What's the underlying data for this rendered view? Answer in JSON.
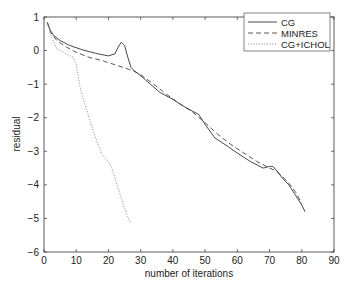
{
  "chart_data": {
    "type": "line",
    "title": "",
    "xlabel": "number of iterations",
    "ylabel": "residual",
    "xlim": [
      0,
      90
    ],
    "ylim": [
      -6,
      1
    ],
    "xticks": [
      "0",
      "10",
      "20",
      "30",
      "40",
      "50",
      "60",
      "70",
      "80",
      "90"
    ],
    "yticks": [
      "1",
      "0",
      "-1",
      "-2",
      "-3",
      "-4",
      "-5",
      "-6"
    ],
    "grid": false,
    "legend_position": "top-right",
    "series": [
      {
        "name": "CG",
        "style": "solid",
        "x": [
          1,
          2,
          3,
          5,
          8,
          12,
          16,
          20,
          22,
          23,
          24,
          25,
          26,
          27,
          28,
          30,
          33,
          36,
          40,
          44,
          46,
          48,
          50,
          53,
          57,
          60,
          64,
          68,
          70,
          71,
          72,
          74,
          76,
          78,
          80,
          81
        ],
        "y": [
          0.85,
          0.6,
          0.45,
          0.3,
          0.15,
          0.02,
          -0.08,
          -0.16,
          -0.1,
          0.1,
          0.25,
          0.15,
          -0.2,
          -0.5,
          -0.6,
          -0.75,
          -1.0,
          -1.25,
          -1.45,
          -1.7,
          -1.8,
          -1.9,
          -2.2,
          -2.6,
          -2.85,
          -3.05,
          -3.3,
          -3.5,
          -3.45,
          -3.45,
          -3.55,
          -3.8,
          -4.0,
          -4.3,
          -4.6,
          -4.8
        ]
      },
      {
        "name": "MINRES",
        "style": "dashed",
        "x": [
          1,
          2,
          4,
          7,
          10,
          14,
          18,
          22,
          26,
          28,
          30,
          34,
          38,
          42,
          46,
          50,
          54,
          58,
          62,
          66,
          70,
          72,
          74,
          76,
          78,
          80
        ],
        "y": [
          0.85,
          0.55,
          0.3,
          0.1,
          -0.05,
          -0.2,
          -0.3,
          -0.42,
          -0.55,
          -0.62,
          -0.72,
          -1.0,
          -1.3,
          -1.58,
          -1.82,
          -2.15,
          -2.5,
          -2.8,
          -3.05,
          -3.3,
          -3.5,
          -3.58,
          -3.75,
          -3.95,
          -4.2,
          -4.55
        ]
      },
      {
        "name": "CG+ICHOL",
        "style": "dotted",
        "x": [
          1,
          2,
          3,
          4,
          6,
          8,
          9,
          10,
          11,
          12,
          13,
          14,
          15,
          16,
          17,
          18,
          19,
          20,
          21,
          22,
          23,
          24,
          25,
          26,
          27
        ],
        "y": [
          0.85,
          0.5,
          0.25,
          0.05,
          -0.05,
          -0.15,
          -0.2,
          -0.4,
          -1.0,
          -1.4,
          -1.7,
          -2.0,
          -2.3,
          -2.6,
          -2.85,
          -3.1,
          -3.2,
          -3.3,
          -3.5,
          -3.8,
          -4.1,
          -4.4,
          -4.7,
          -4.95,
          -5.15
        ]
      }
    ]
  }
}
